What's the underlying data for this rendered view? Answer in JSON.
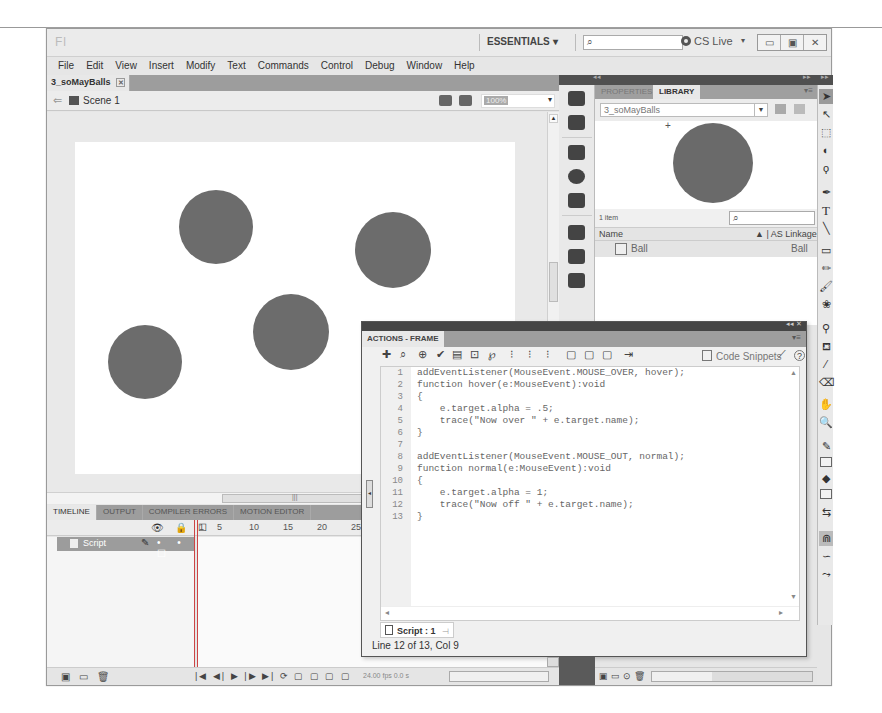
{
  "titlebar": {
    "logo": "Fl",
    "workspace": "ESSENTIALS",
    "workspace_arrow": "▾",
    "search_placeholder": "",
    "search_icon": "⌕",
    "cs_live": "CS Live",
    "cs_live_arrow": "▾",
    "window_buttons": [
      "▭",
      "▣",
      "✕"
    ]
  },
  "menubar": {
    "items": [
      "File",
      "Edit",
      "View",
      "Insert",
      "Modify",
      "Text",
      "Commands",
      "Control",
      "Debug",
      "Window",
      "Help"
    ]
  },
  "document": {
    "tab": "3_soMayBalls",
    "tab_close": "✕",
    "scene_back": "⇐",
    "scene": "Scene 1",
    "zoom": "100%",
    "zoom_arrow": "▾"
  },
  "stage": {
    "background": "#ffffff",
    "ball_color": "#6c6c6c",
    "balls": [
      {
        "name": "ball-top-left",
        "x": 104,
        "y": 48,
        "d": 74
      },
      {
        "name": "ball-top-right",
        "x": 280,
        "y": 70,
        "d": 76
      },
      {
        "name": "ball-center",
        "x": 178,
        "y": 152,
        "d": 76
      },
      {
        "name": "ball-bottom-left",
        "x": 33,
        "y": 183,
        "d": 74
      }
    ]
  },
  "timeline": {
    "tabs": [
      "TIMELINE",
      "OUTPUT",
      "COMPILER ERRORS",
      "MOTION EDITOR"
    ],
    "header_icons": "👁 🔒 ☐",
    "ruler": [
      "1",
      "5",
      "10",
      "15",
      "20",
      "25"
    ],
    "layer": {
      "name": "Script",
      "pencil": "✎",
      "dots": "• • ☐"
    },
    "footer_left": "▣ ▭ 🗑",
    "footer_controls": "|◀ ◀| ▶ |▶ ▶| ⟳ ▢ ▢ ▢ ▢",
    "fps": "24.00 fps  0.0 s"
  },
  "library": {
    "tabs": [
      "PROPERTIES",
      "LIBRARY"
    ],
    "active_tab": "LIBRARY",
    "document": "3_soMayBalls",
    "item_count": "1 item",
    "search_icon": "⌕",
    "columns": [
      "Name",
      "▲ | AS Linkage"
    ],
    "items": [
      {
        "name": "Ball",
        "linkage": "Ball"
      }
    ]
  },
  "tools": [
    {
      "name": "selection-tool",
      "glyph": "➤",
      "selected": true
    },
    {
      "name": "subselection-tool",
      "glyph": "↖"
    },
    {
      "name": "free-transform-tool",
      "glyph": "⬚"
    },
    {
      "name": "3d-rotation-tool",
      "glyph": "◐"
    },
    {
      "name": "lasso-tool",
      "glyph": "ϙ"
    },
    {
      "name": "pen-tool",
      "glyph": "✒"
    },
    {
      "name": "text-tool",
      "glyph": "T"
    },
    {
      "name": "line-tool",
      "glyph": "╲"
    },
    {
      "name": "rectangle-tool",
      "glyph": "▭"
    },
    {
      "name": "pencil-tool",
      "glyph": "✏"
    },
    {
      "name": "brush-tool",
      "glyph": "🖌"
    },
    {
      "name": "deco-tool",
      "glyph": "❀"
    },
    {
      "name": "bone-tool",
      "glyph": "⚲"
    },
    {
      "name": "paint-bucket-tool",
      "glyph": "⛾"
    },
    {
      "name": "eyedropper-tool",
      "glyph": "⁄"
    },
    {
      "name": "eraser-tool",
      "glyph": "⌫"
    },
    {
      "name": "hand-tool",
      "glyph": "✋"
    },
    {
      "name": "zoom-tool",
      "glyph": "🔍"
    },
    {
      "name": "stroke-color",
      "glyph": "✎"
    },
    {
      "name": "fill-color",
      "glyph": "◆"
    },
    {
      "name": "swap-colors",
      "glyph": "⇆"
    },
    {
      "name": "snap-to-objects",
      "glyph": "⋒"
    },
    {
      "name": "smooth",
      "glyph": "∽"
    },
    {
      "name": "straighten",
      "glyph": "⤳"
    }
  ],
  "actions": {
    "title": "ACTIONS - FRAME",
    "toolbar_icons": [
      "✚",
      "⌕",
      "⊕",
      "✔",
      "▤",
      "⊡",
      "℘",
      "⁝",
      "⁝",
      "⁝",
      "▢",
      "▢",
      "▢",
      "⇥"
    ],
    "code_snippets": "Code Snippets",
    "wand": "⟋",
    "help": "?",
    "lines": [
      "addEventListener(MouseEvent.MOUSE_OVER, hover);",
      "function hover(e:MouseEvent):void",
      "{",
      "    e.target.alpha = .5;",
      "    trace(\"Now over \" + e.target.name);",
      "}",
      "",
      "addEventListener(MouseEvent.MOUSE_OUT, normal);",
      "function normal(e:MouseEvent):void",
      "{",
      "    e.target.alpha = 1;",
      "    trace(\"Now off \" + e.target.name);",
      "}"
    ],
    "line_numbers": [
      "1",
      "2",
      "3",
      "4",
      "5",
      "6",
      "7",
      "8",
      "9",
      "10",
      "11",
      "12",
      "13"
    ],
    "script_tab": "Script : 1",
    "status": "Line 12 of 13, Col 9"
  }
}
